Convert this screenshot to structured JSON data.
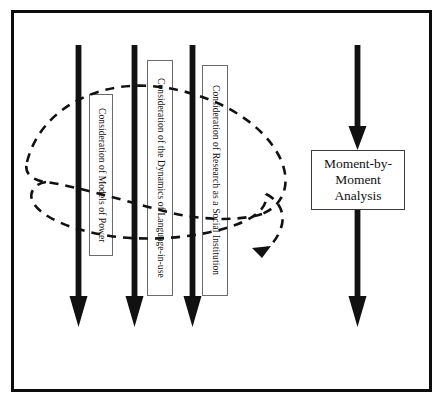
{
  "figure": {
    "type": "flow-diagram",
    "background_color": "#ffffff",
    "border_color": "#0d0d0d",
    "solid_arrow_color": "#111111",
    "dashed_arrow_color": "#111111",
    "label_box_border_color": "#6b6b6b",
    "text_color": "#111111"
  },
  "vertical_arrows": [
    {
      "name": "arrow-models-of-power",
      "x": 78.5,
      "top": 45,
      "bottom": 327
    },
    {
      "name": "arrow-dynamics-of-language",
      "x": 134.5,
      "top": 45,
      "bottom": 327
    },
    {
      "name": "arrow-research-institution",
      "x": 192.5,
      "top": 45,
      "bottom": 327
    },
    {
      "name": "arrow-moment-by-moment",
      "x": 357.5,
      "top": 45,
      "bottom": 327
    }
  ],
  "vertical_labels": [
    {
      "id": "models-of-power",
      "text": "Consideration of Models of Power",
      "left": 89,
      "top": 94,
      "width": 24,
      "height": 162
    },
    {
      "id": "dynamics-of-language-in-use",
      "text": "Consideration of the Dynamics of Language-in-use",
      "left": 147,
      "top": 60,
      "width": 26,
      "height": 236
    },
    {
      "id": "research-as-social-institution",
      "text": "Consideration of Research as a Social Institution",
      "left": 202,
      "top": 65,
      "width": 26,
      "height": 231
    }
  ],
  "moment_box": {
    "id": "moment-by-moment-analysis",
    "lines": [
      "Moment-by-",
      "Moment",
      "Analysis"
    ],
    "text": "Moment-by-Moment Analysis",
    "left": 311,
    "top": 150,
    "width": 94,
    "height": 60
  },
  "dashed_spiral": {
    "id": "recursive-dashed-loop",
    "description": "Dashed looping spiral path crossing the three vertical process arrows, terminating in an arrowhead pointing down-left",
    "dash_pattern": "9 7",
    "stroke_width": 2.6,
    "arrowhead_at": {
      "x": 258,
      "y": 251
    }
  }
}
